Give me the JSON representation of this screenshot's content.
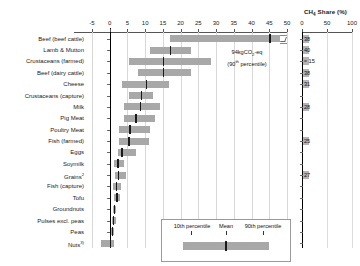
{
  "chart_data": {
    "type": "bar",
    "title": "",
    "xlabel": "",
    "ylabel": "",
    "xlim": [
      -5,
      50
    ],
    "xticks": [
      -5,
      0,
      5,
      10,
      15,
      20,
      25,
      30,
      35,
      40,
      45,
      50
    ],
    "grid": true,
    "legend_position": "inside-bottom-right",
    "categories": [
      "Beef (beef cattle)",
      "Lamb & Mutton",
      "Crustaceans (farmed)",
      "Beef (dairy cattle)",
      "Cheese",
      "Crustaceans (capture)",
      "Milk",
      "Pig Meat",
      "Poultry Meat",
      "Fish (farmed)",
      "Eggs",
      "Soymilk",
      "Grains",
      "Fish (capture)",
      "Tofu",
      "Groundnuts",
      "Pulses excl. peas",
      "Peas",
      "Nuts"
    ],
    "category_superscripts": [
      "",
      "",
      "",
      "",
      "",
      "",
      "",
      "",
      "",
      "",
      "",
      "",
      "2",
      "",
      "",
      "",
      "",
      "",
      "3)"
    ],
    "series": [
      {
        "name": "10th percentile",
        "values": [
          17.0,
          11.3,
          5.5,
          8.0,
          3.4,
          5.5,
          4.0,
          3.9,
          2.6,
          2.6,
          2.2,
          1.3,
          1.4,
          0.9,
          1.3,
          0.8,
          0.5,
          0.4,
          -2.6
        ]
      },
      {
        "name": "Mean",
        "values": [
          45.0,
          17.0,
          15.0,
          15.0,
          10.2,
          8.8,
          8.5,
          7.2,
          5.5,
          5.2,
          3.3,
          2.1,
          2.3,
          1.7,
          1.9,
          1.1,
          0.8,
          0.6,
          0.0
        ]
      },
      {
        "name": "90th percentile",
        "values": [
          94.0,
          23.0,
          28.5,
          23.0,
          16.8,
          12.1,
          14.3,
          12.8,
          11.3,
          11.2,
          7.5,
          4.0,
          4.6,
          3.1,
          2.9,
          1.9,
          1.7,
          1.1,
          1.1
        ]
      }
    ],
    "axis_break_note": "Beef (beef cattle) bar extends beyond axis maximum",
    "annotation": {
      "line1": "94kgCO2-eq",
      "line2": "(90th percentile)"
    },
    "legend": {
      "left_label": "10th percentile",
      "mid_label": "Mean",
      "right_label": "90th percentile"
    },
    "secondary_panel": {
      "title": "CH4 Share (%)",
      "xticks": [
        0,
        50,
        100
      ],
      "xlim": [
        0,
        100
      ],
      "values": [
        {
          "category": "Beef (beef cattle)",
          "label": "38",
          "value": 38
        },
        {
          "category": "Lamb & Mutton",
          "label": "40",
          "value": 40
        },
        {
          "category": "Crustaceans (farmed)",
          "label": "≈ 15",
          "value": 15
        },
        {
          "category": "Beef (dairy cattle)",
          "label": "38",
          "value": 38
        },
        {
          "category": "Cheese",
          "label": "31",
          "value": 31
        },
        {
          "category": "Milk",
          "label": "28",
          "value": 28
        },
        {
          "category": "Fish (farmed)",
          "label": "25",
          "value": 25
        },
        {
          "category": "Grains",
          "label": "27",
          "value": 27
        }
      ]
    }
  },
  "units": {
    "x_axis_units": "kg CO2-eq"
  }
}
